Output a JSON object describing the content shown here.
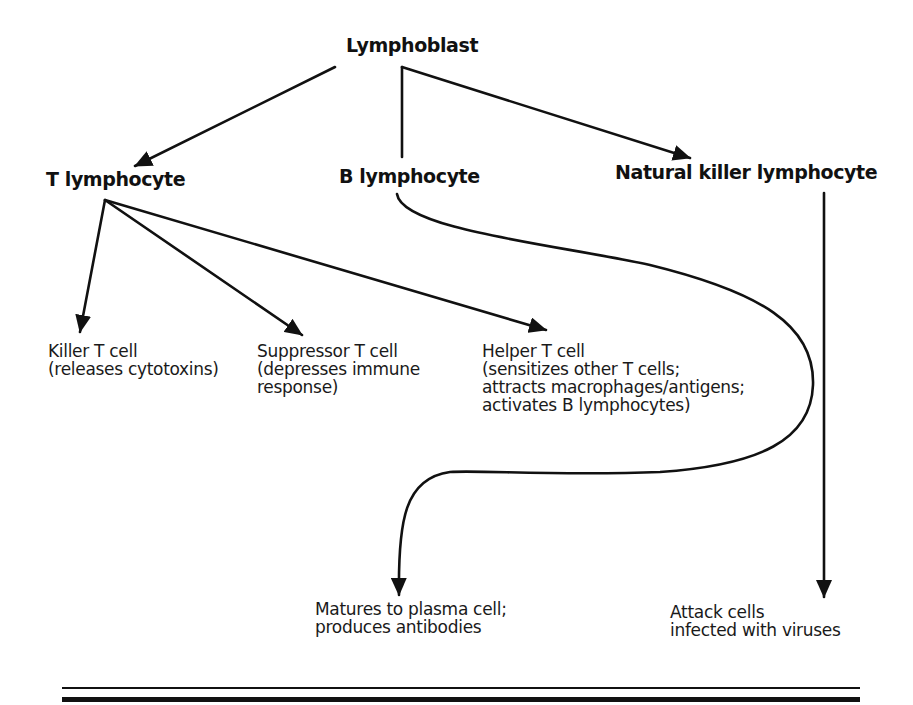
{
  "diagram": {
    "nodes": {
      "root": {
        "label": "Lymphoblast"
      },
      "t_lymphocyte": {
        "label": "T lymphocyte"
      },
      "b_lymphocyte": {
        "label": "B lymphocyte"
      },
      "nk_lymphocyte": {
        "label": "Natural killer lymphocyte"
      },
      "killer_t": {
        "lines": [
          "Killer T cell",
          "(releases cytotoxins)"
        ]
      },
      "suppressor_t": {
        "lines": [
          "Suppressor T cell",
          "(depresses immune",
          "response)"
        ]
      },
      "helper_t": {
        "lines": [
          "Helper T cell",
          "(sensitizes other T cells;",
          "attracts macrophages/antigens;",
          "activates B lymphocytes)"
        ]
      },
      "plasma": {
        "lines": [
          "Matures to plasma cell;",
          "produces antibodies"
        ]
      },
      "nk_function": {
        "lines": [
          "Attack cells",
          "infected with viruses"
        ]
      }
    },
    "edges": [
      {
        "from": "Lymphoblast",
        "to": "T lymphocyte",
        "style": "straight-arrow"
      },
      {
        "from": "Lymphoblast",
        "to": "B lymphocyte",
        "style": "elbow-line"
      },
      {
        "from": "Lymphoblast",
        "to": "Natural killer lymphocyte",
        "style": "straight-arrow"
      },
      {
        "from": "T lymphocyte",
        "to": "Killer T cell",
        "style": "straight-arrow"
      },
      {
        "from": "T lymphocyte",
        "to": "Suppressor T cell",
        "style": "straight-arrow"
      },
      {
        "from": "T lymphocyte",
        "to": "Helper T cell",
        "style": "straight-arrow"
      },
      {
        "from": "B lymphocyte",
        "to": "Matures to plasma cell",
        "style": "curved-arrow"
      },
      {
        "from": "Natural killer lymphocyte",
        "to": "Attack cells infected with viruses",
        "style": "vertical-arrow"
      }
    ],
    "colors": {
      "ink": "#111111",
      "background": "#ffffff"
    }
  }
}
